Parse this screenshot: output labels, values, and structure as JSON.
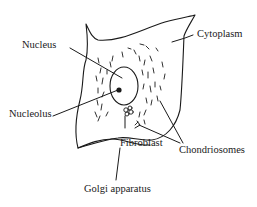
{
  "diagram": {
    "type": "labeled-biology-sketch",
    "labels": {
      "nucleus": "Nucleus",
      "cytoplasm": "Cytoplasm",
      "nucleolus": "Nucleolus",
      "fibroblast": "Fibroblast",
      "chondriosomes": "Chondriosomes",
      "golgi": "Golgi  apparatus"
    },
    "colors": {
      "ink": "#1a1a1a",
      "background": "#ffffff"
    }
  }
}
